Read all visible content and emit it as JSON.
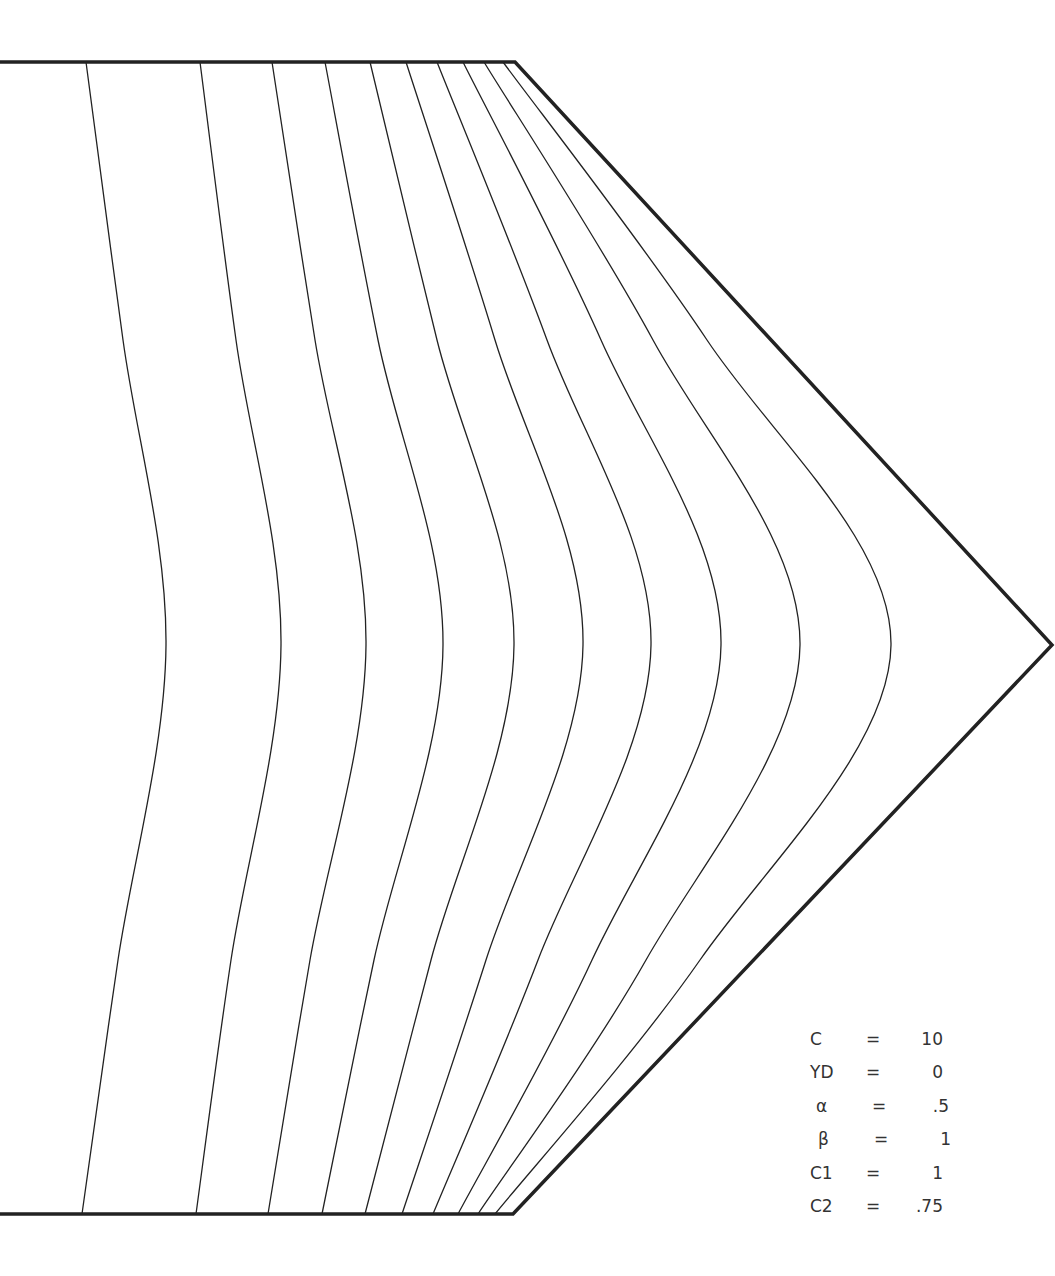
{
  "figure": {
    "type": "grid-lines-in-domain",
    "boundary": {
      "top_left": [
        0,
        62
      ],
      "top_corner": [
        515,
        62
      ],
      "apex": [
        1052,
        645
      ],
      "bottom_corner": [
        513,
        1214
      ],
      "bottom_left": [
        0,
        1214
      ]
    },
    "curves": [
      {
        "top": 86,
        "y340": 123,
        "mid": 166,
        "y960": 118,
        "bottom": 82
      },
      {
        "top": 200,
        "y340": 236,
        "mid": 281,
        "y960": 231,
        "bottom": 196
      },
      {
        "top": 272,
        "y340": 315,
        "mid": 366,
        "y960": 310,
        "bottom": 268
      },
      {
        "top": 325,
        "y340": 378,
        "mid": 443,
        "y960": 374,
        "bottom": 322
      },
      {
        "top": 370,
        "y340": 437,
        "mid": 514,
        "y960": 431,
        "bottom": 365
      },
      {
        "top": 406,
        "y340": 495,
        "mid": 583,
        "y960": 486,
        "bottom": 402
      },
      {
        "top": 437,
        "y340": 547,
        "mid": 651,
        "y960": 538,
        "bottom": 433
      },
      {
        "top": 463,
        "y340": 601,
        "mid": 721,
        "y960": 592,
        "bottom": 458
      },
      {
        "top": 484,
        "y340": 653,
        "mid": 800,
        "y960": 646,
        "bottom": 478
      },
      {
        "top": 503,
        "y340": 707,
        "mid": 891,
        "y960": 700,
        "bottom": 495
      }
    ]
  },
  "parameters": [
    {
      "name": "C",
      "value": "10"
    },
    {
      "name": "YD",
      "value": "0"
    },
    {
      "name": "α",
      "value": ".5"
    },
    {
      "name": "β",
      "value": "1"
    },
    {
      "name": "C1",
      "value": "1"
    },
    {
      "name": "C2",
      "value": ".75"
    }
  ],
  "equals_sign": "="
}
